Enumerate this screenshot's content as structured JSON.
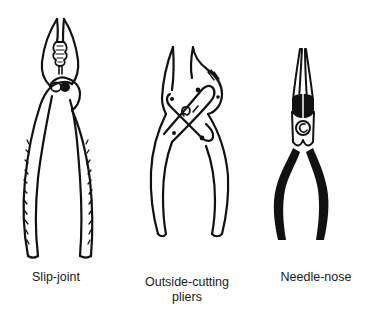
{
  "figure": {
    "tools": [
      {
        "id": "slip-joint",
        "label": "Slip-joint",
        "icon": "slip-joint-pliers-icon"
      },
      {
        "id": "outside-cutting",
        "label_line1": "Outside-cutting",
        "label_line2": "pliers",
        "icon": "outside-cutting-pliers-icon"
      },
      {
        "id": "needle-nose",
        "label": "Needle-nose",
        "icon": "needle-nose-pliers-icon"
      }
    ],
    "colors": {
      "ink": "#111111",
      "background": "#ffffff"
    }
  }
}
